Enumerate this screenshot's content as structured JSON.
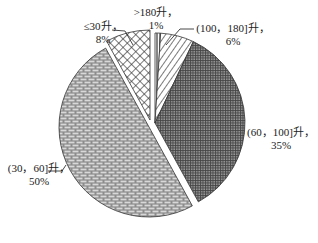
{
  "chart_data": {
    "type": "pie",
    "title": "",
    "exploded": true,
    "start_angle_deg": 0,
    "direction": "clockwise",
    "slices": [
      {
        "name": ">180升",
        "value": 1,
        "label": ">180升，",
        "pct_label": "1%",
        "pattern": "vertical-lines",
        "offset": [
          0,
          0
        ]
      },
      {
        "name": "(100，180]升",
        "value": 6,
        "label": "(100，180]升，",
        "pct_label": "6%",
        "pattern": "diagonal-lines",
        "offset": [
          0,
          0
        ]
      },
      {
        "name": "(60，100]升",
        "value": 35,
        "label": "(60，100]升，",
        "pct_label": "35%",
        "pattern": "fine-grid",
        "offset": [
          0,
          0
        ]
      },
      {
        "name": "(30，60]升",
        "value": 50,
        "label": "(30，60]升，",
        "pct_label": "50%",
        "pattern": "brick",
        "offset": [
          -6,
          4
        ]
      },
      {
        "name": "≤30升",
        "value": 8,
        "label": "≤30升，",
        "pct_label": "8%",
        "pattern": "crosshatch",
        "offset": [
          -5,
          -3
        ]
      }
    ],
    "legend": "none",
    "colors": {
      "stroke": "#333333",
      "fill_light": "#ffffff",
      "fill_dark": "#555555",
      "text": "#222222"
    }
  },
  "labels": {
    "gt180": {
      "line1": ">180升，",
      "line2": "1%"
    },
    "l100_180": {
      "line1": "(100，180]升，",
      "line2": "6%"
    },
    "l60_100": {
      "line1": "(60，100]升，",
      "line2": "35%"
    },
    "l30_60": {
      "line1": "(30，60]升，",
      "line2": "50%"
    },
    "le30": {
      "line1": "≤30升，",
      "line2": "8%"
    }
  }
}
